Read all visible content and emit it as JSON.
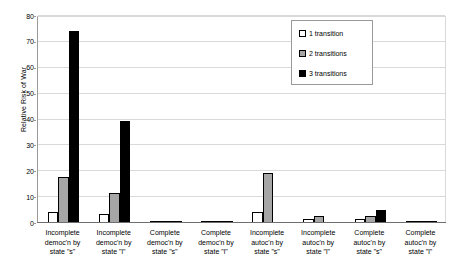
{
  "chart_data": {
    "type": "bar",
    "title": "",
    "xlabel": "",
    "ylabel": "Relative Risk of War",
    "ylim": [
      0,
      80
    ],
    "ytick_step": 10,
    "yticks": [
      0,
      10,
      20,
      30,
      40,
      50,
      60,
      70,
      80
    ],
    "grid": true,
    "legend_position": "top-right",
    "categories": [
      "Incomplete democ'n by state \"s\"",
      "Incomplete democ'n by state \"l\"",
      "Complete democ'n by state \"s\"",
      "Complete democ'n by state \"l\"",
      "Incomplete autoc'n by state \"s\"",
      "Incomplete autoc'n by state \"l\"",
      "Complete autoc'n by state \"s\"",
      "Complete autoc'n by state \"l\""
    ],
    "category_lines": [
      [
        "Incomplete",
        "democ'n by",
        "state \"s\""
      ],
      [
        "Incomplete",
        "democ'n by",
        "state \"l\""
      ],
      [
        "Complete",
        "democ'n by",
        "state \"s\""
      ],
      [
        "Complete",
        "democ'n by",
        "state \"l\""
      ],
      [
        "Incomplete",
        "autoc'n by",
        "state \"s\""
      ],
      [
        "Incomplete",
        "autoc'n by",
        "state \"l\""
      ],
      [
        "Complete",
        "autoc'n by",
        "state \"s\""
      ],
      [
        "Complete",
        "autoc'n by",
        "state \"l\""
      ]
    ],
    "series": [
      {
        "name": "1 transition",
        "color": "#ffffff",
        "values": [
          4.2,
          3.3,
          0.4,
          0.2,
          4.3,
          1.7,
          1.7,
          0.7
        ]
      },
      {
        "name": "2 transitions",
        "color": "#a6a6a6",
        "values": [
          17.8,
          11.6,
          0.2,
          0.2,
          19.5,
          2.9,
          2.9,
          0.3
        ]
      },
      {
        "name": "3 transitions",
        "color": "#000000",
        "values": [
          74.3,
          39.4,
          0.2,
          0.2,
          0,
          0,
          5.0,
          0.2
        ]
      }
    ]
  },
  "legend": {
    "items": [
      {
        "label": "1 transition",
        "swatch": "white-square-icon"
      },
      {
        "label": "2 transitions",
        "swatch": "gray-square-icon"
      },
      {
        "label": "3 transitions",
        "swatch": "black-square-icon"
      }
    ]
  }
}
